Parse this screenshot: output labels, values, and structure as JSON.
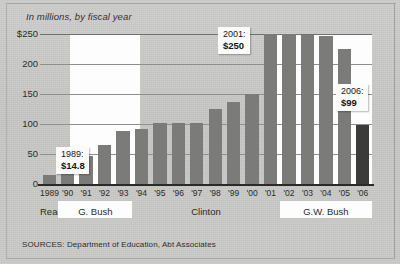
{
  "subtitle": "In millions, by fiscal year",
  "sources": "SOURCES: Department of Education, Abt Associates",
  "callouts": [
    {
      "name": "callout-1989",
      "year": "1989:",
      "value": "$14.8"
    },
    {
      "name": "callout-2001",
      "year": "2001:",
      "value": "$250"
    },
    {
      "name": "callout-2006",
      "year": "2006:",
      "value": "$99"
    }
  ],
  "eras": [
    {
      "label": "Reagan",
      "start": 0,
      "end": 1
    },
    {
      "label": "G. Bush",
      "start": 1,
      "end": 5
    },
    {
      "label": "Clinton",
      "start": 5,
      "end": 13
    },
    {
      "label": "G.W. Bush",
      "start": 13,
      "end": 18
    }
  ],
  "colors": {
    "bar": "#7b7b79",
    "bar_highlight": "#3b3b39",
    "background": "#c9c9c7",
    "band": "#fdfdfd",
    "grid": "#8e8e8c",
    "axis": "#2a2a28"
  },
  "chart_data": {
    "type": "bar",
    "title": "",
    "subtitle": "In millions, by fiscal year",
    "xlabel": "",
    "ylabel": "",
    "ylim": [
      0,
      250
    ],
    "yticks": [
      0,
      50,
      100,
      150,
      200,
      250
    ],
    "ytick_labels": [
      "0",
      "50",
      "100",
      "150",
      "200",
      "$250"
    ],
    "grid": true,
    "legend": "none",
    "categories": [
      "1989",
      "'90",
      "'91",
      "'92",
      "'93",
      "'94",
      "'95",
      "'96",
      "'97",
      "'98",
      "'99",
      "'00",
      "'01",
      "'02",
      "'03",
      "'04",
      "'05",
      "'06"
    ],
    "values": [
      14.8,
      22,
      47,
      65,
      88,
      92,
      101,
      101,
      101,
      125,
      137,
      150,
      250,
      250,
      248,
      247,
      225,
      99
    ],
    "highlight_index": 17,
    "annotations": [
      {
        "category": "1989",
        "text": "1989: $14.8"
      },
      {
        "category": "'01",
        "text": "2001: $250"
      },
      {
        "category": "'06",
        "text": "2006: $99"
      }
    ]
  }
}
